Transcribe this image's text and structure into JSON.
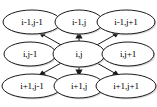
{
  "diagram": {
    "background_color": "#ffffff",
    "node_fill": "#ffffff",
    "node_stroke": "#1a1a1a",
    "shadow_color": "#b8b8b8",
    "edge_color": "#1a1a1a",
    "center_node_id": "center",
    "nodes": [
      {
        "id": "top-left",
        "label": "i-1,j-1",
        "cx": 32,
        "cy": 22,
        "rx": 29,
        "ry": 12
      },
      {
        "id": "top-center",
        "label": "i-1,j",
        "cx": 79,
        "cy": 22,
        "rx": 24,
        "ry": 12
      },
      {
        "id": "top-right",
        "label": "i-1,j+1",
        "cx": 126,
        "cy": 22,
        "rx": 29,
        "ry": 12
      },
      {
        "id": "middle-left",
        "label": "i,j-1",
        "cx": 30,
        "cy": 54,
        "rx": 26,
        "ry": 12
      },
      {
        "id": "center",
        "label": "i,j",
        "cx": 79,
        "cy": 54,
        "rx": 26,
        "ry": 13
      },
      {
        "id": "middle-right",
        "label": "i,j+1",
        "cx": 128,
        "cy": 54,
        "rx": 26,
        "ry": 12
      },
      {
        "id": "bottom-left",
        "label": "i+1,j-1",
        "cx": 32,
        "cy": 86,
        "rx": 30,
        "ry": 12
      },
      {
        "id": "bottom-center",
        "label": "i+1,j",
        "cx": 79,
        "cy": 86,
        "rx": 25,
        "ry": 12
      },
      {
        "id": "bottom-right",
        "label": "i+1,j+1",
        "cx": 126,
        "cy": 86,
        "rx": 30,
        "ry": 12
      }
    ],
    "edges": [
      {
        "id": "edge-to-top-left",
        "from": "center",
        "to": "top-left",
        "direction": "up-left",
        "x1": 62,
        "y1": 45,
        "x2": 41,
        "y2": 34
      },
      {
        "id": "edge-to-top-center",
        "from": "center",
        "to": "top-center",
        "direction": "up",
        "x1": 79,
        "y1": 41,
        "x2": 79,
        "y2": 33
      },
      {
        "id": "edge-to-top-right",
        "from": "center",
        "to": "top-right",
        "direction": "up-right",
        "x1": 96,
        "y1": 45,
        "x2": 117,
        "y2": 34
      },
      {
        "id": "edge-to-middle-left",
        "from": "center",
        "to": "middle-left",
        "direction": "left",
        "x1": 53,
        "y1": 54,
        "x2": 57,
        "y2": 54
      },
      {
        "id": "edge-to-middle-right",
        "from": "center",
        "to": "middle-right",
        "direction": "right",
        "x1": 105,
        "y1": 54,
        "x2": 101,
        "y2": 54
      },
      {
        "id": "edge-to-bottom-left",
        "from": "center",
        "to": "bottom-left",
        "direction": "down-left",
        "x1": 62,
        "y1": 63,
        "x2": 41,
        "y2": 74
      },
      {
        "id": "edge-to-bottom-center",
        "from": "center",
        "to": "bottom-center",
        "direction": "down",
        "x1": 79,
        "y1": 67,
        "x2": 79,
        "y2": 75
      },
      {
        "id": "edge-to-bottom-right",
        "from": "center",
        "to": "bottom-right",
        "direction": "down-right",
        "x1": 96,
        "y1": 63,
        "x2": 117,
        "y2": 74
      }
    ]
  }
}
